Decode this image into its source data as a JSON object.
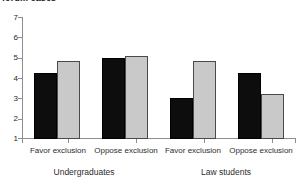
{
  "chart_data": {
    "type": "bar",
    "title": "forum cases",
    "xlabel": "",
    "ylabel": "",
    "ylim": [
      1,
      7
    ],
    "yticks": [
      1,
      2,
      3,
      4,
      5,
      6,
      7
    ],
    "ytick_labels": [
      "1",
      "2",
      "3",
      "4",
      "5",
      "6",
      "7"
    ],
    "grid": false,
    "legend": "none",
    "categories": [
      "Favor exclusion",
      "Oppose exclusion",
      "Favor exclusion",
      "Oppose exclusion"
    ],
    "groups": [
      {
        "label": "Undergraduates",
        "categories": [
          "Favor exclusion",
          "Oppose exclusion"
        ]
      },
      {
        "label": "Law students",
        "categories": [
          "Favor exclusion",
          "Oppose exclusion"
        ]
      }
    ],
    "series": [
      {
        "name": "series-1",
        "color": "#0d0d0d",
        "values": [
          4.25,
          5.0,
          3.0,
          4.25
        ]
      },
      {
        "name": "series-2",
        "color": "#c9c9c9",
        "values": [
          4.85,
          5.1,
          4.85,
          3.2
        ]
      }
    ]
  },
  "axis": {
    "y_labels": [
      "7",
      "6",
      "5",
      "4",
      "3",
      "2",
      "1"
    ]
  }
}
